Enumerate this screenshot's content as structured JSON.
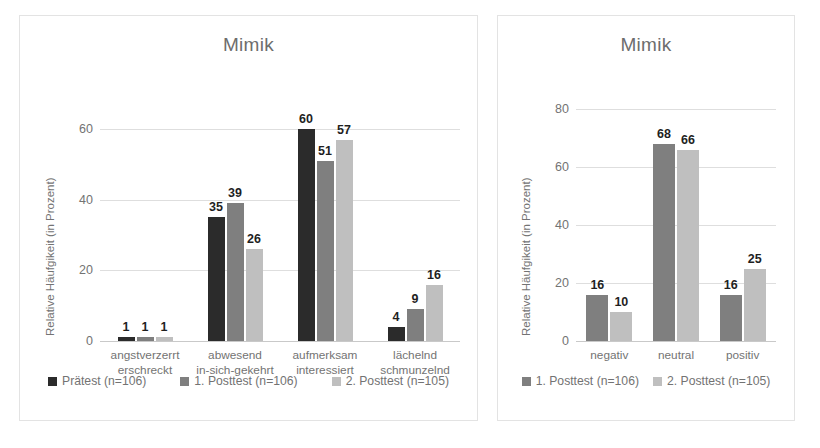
{
  "colors": {
    "series1": "#2b2b2b",
    "series2": "#7f7f7f",
    "series3": "#bfbfbf",
    "grid": "#dedede",
    "axis": "#c9c9c9",
    "text_muted": "#737373",
    "text_dark": "#1f1f1f",
    "frame_border": "#e3e3e3",
    "background": "#ffffff"
  },
  "charts": [
    {
      "id": "chart-left",
      "title": "Mimik",
      "ylabel": "Relative Häufgikeit (in Prozent)",
      "yticks": [
        "0",
        "20",
        "40",
        "60"
      ],
      "legend": [
        {
          "label": "Prätest (n=106)",
          "color": "#2b2b2b"
        },
        {
          "label": "1. Posttest (n=106)",
          "color": "#7f7f7f"
        },
        {
          "label": "2. Posttest (n=105)",
          "color": "#bfbfbf"
        }
      ]
    },
    {
      "id": "chart-right",
      "title": "Mimik",
      "ylabel": "Relative Häufgikeit (in Prozent)",
      "yticks": [
        "0",
        "20",
        "40",
        "60",
        "80"
      ],
      "legend": [
        {
          "label": "1. Posttest (n=106)",
          "color": "#7f7f7f"
        },
        {
          "label": "2. Posttest (n=105)",
          "color": "#bfbfbf"
        }
      ]
    }
  ],
  "chart_data": [
    {
      "type": "bar",
      "title": "Mimik",
      "xlabel": "",
      "ylabel": "Relative Häufgikeit (in Prozent)",
      "ylim": [
        0,
        68
      ],
      "yticks": [
        0,
        20,
        40,
        60
      ],
      "grid": true,
      "legend_position": "bottom",
      "categories": [
        "angstverzerrt\nerschreckt",
        "abwesend\nin-sich-gekehrt",
        "aufmerksam\ninteressiert",
        "lächelnd\nschmunzelnd"
      ],
      "category_lines": [
        [
          "angstverzerrt",
          "erschreckt"
        ],
        [
          "abwesend",
          "in-sich-gekehrt"
        ],
        [
          "aufmerksam",
          "interessiert"
        ],
        [
          "lächelnd",
          "schmunzelnd"
        ]
      ],
      "series": [
        {
          "name": "Prätest (n=106)",
          "color": "#2b2b2b",
          "values": [
            1,
            35,
            60,
            4
          ]
        },
        {
          "name": "1. Posttest (n=106)",
          "color": "#7f7f7f",
          "values": [
            1,
            39,
            51,
            9
          ]
        },
        {
          "name": "2. Posttest (n=105)",
          "color": "#bfbfbf",
          "values": [
            1,
            26,
            57,
            16
          ]
        }
      ]
    },
    {
      "type": "bar",
      "title": "Mimik",
      "xlabel": "",
      "ylabel": "Relative Häufgikeit (in Prozent)",
      "ylim": [
        0,
        88
      ],
      "yticks": [
        0,
        20,
        40,
        60,
        80
      ],
      "grid": true,
      "legend_position": "bottom",
      "categories": [
        "negativ",
        "neutral",
        "positiv"
      ],
      "category_lines": [
        [
          "negativ"
        ],
        [
          "neutral"
        ],
        [
          "positiv"
        ]
      ],
      "series": [
        {
          "name": "1. Posttest (n=106)",
          "color": "#7f7f7f",
          "values": [
            16,
            68,
            16
          ]
        },
        {
          "name": "2. Posttest (n=105)",
          "color": "#bfbfbf",
          "values": [
            10,
            66,
            25
          ]
        }
      ]
    }
  ]
}
